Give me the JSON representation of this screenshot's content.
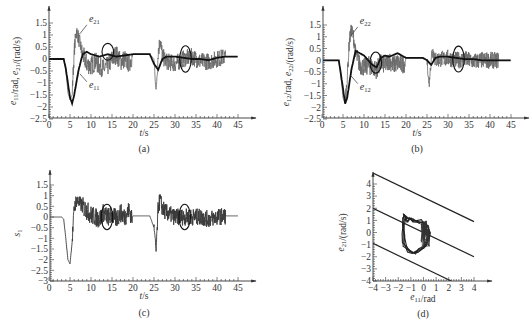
{
  "chart_data": [
    {
      "id": "a",
      "type": "line",
      "panel_label": "(a)",
      "xlabel": "t/s",
      "ylabel": "e11/rad, e21/(rad/s)",
      "xlim": [
        0,
        45
      ],
      "ylim": [
        -2.5,
        1.5
      ],
      "xticks": [
        0,
        5,
        10,
        15,
        20,
        25,
        30,
        35,
        40,
        45
      ],
      "yticks": [
        1.5,
        1,
        0.5,
        0,
        -0.5,
        -1,
        -1.5,
        -2,
        -2.5
      ],
      "ytick_labels": [
        "1.5",
        "1",
        "0.5",
        "0",
        "−0.5",
        "−1",
        "−1.5",
        "−2",
        "−2.5"
      ],
      "series": [
        {
          "name": "e21",
          "style": "noisy-gray",
          "x": [
            0,
            3.5,
            4,
            4.5,
            5,
            5.5,
            6,
            6.5,
            7,
            8,
            9,
            10,
            11,
            12,
            13,
            14,
            15,
            16,
            17,
            18,
            19,
            19.8,
            20,
            24,
            25,
            25.5,
            26,
            26.5,
            27,
            28,
            30,
            32,
            34,
            36,
            38,
            40,
            42,
            45
          ],
          "y": [
            0,
            0,
            -0.4,
            -1.4,
            -1.7,
            -1.5,
            0.3,
            1.2,
            0.9,
            0.2,
            -0.2,
            -0.3,
            -0.1,
            -0.3,
            -0.4,
            -0.3,
            0.0,
            0.2,
            -0.1,
            0.0,
            -0.2,
            0.1,
            0.2,
            0.2,
            0.0,
            -1.4,
            0.3,
            0.8,
            0.1,
            -0.1,
            -0.2,
            0.0,
            0.1,
            -0.1,
            -0.1,
            0.0,
            0.1,
            0.1
          ]
        },
        {
          "name": "e11",
          "style": "smooth-black",
          "x": [
            0,
            3.5,
            4,
            5,
            5.5,
            6,
            7,
            8,
            9,
            10,
            12,
            14,
            16,
            18,
            20,
            24,
            25,
            26,
            27,
            28,
            30,
            32,
            34,
            36,
            38,
            40,
            42,
            45
          ],
          "y": [
            0,
            0,
            -0.4,
            -1.6,
            -1.85,
            -1.5,
            -0.5,
            0.2,
            0.3,
            0.2,
            0.1,
            0.2,
            0.1,
            0.15,
            0.2,
            0.2,
            -0.2,
            -0.45,
            0.0,
            0.1,
            0.1,
            0.05,
            0.0,
            0.0,
            -0.05,
            0.05,
            0.1,
            0.1
          ]
        }
      ],
      "annotations": [
        {
          "text": "e21",
          "x": 9.5,
          "y": 1.55
        },
        {
          "text": "e11",
          "x": 9.5,
          "y": -1.2
        }
      ],
      "ellipses": [
        {
          "cx": 14,
          "cy": 0.3,
          "rx": 0.9,
          "ry": 0.35
        },
        {
          "cx": 32.5,
          "cy": 0.0,
          "rx": 0.9,
          "ry": 0.55
        }
      ]
    },
    {
      "id": "b",
      "type": "line",
      "panel_label": "(b)",
      "xlabel": "t/s",
      "ylabel": "e12/rad, e22/(rad/s)",
      "xlim": [
        0,
        45
      ],
      "ylim": [
        -2.5,
        1.5
      ],
      "xticks": [
        0,
        5,
        10,
        15,
        20,
        25,
        30,
        35,
        40,
        45
      ],
      "yticks": [
        1.5,
        1,
        0.5,
        0,
        -0.5,
        -1,
        -1.5,
        -2,
        -2.5
      ],
      "ytick_labels": [
        "1.5",
        "1",
        "0.5",
        "0",
        "−0.5",
        "−1",
        "−1.5",
        "−2",
        "−2.5"
      ],
      "series": [
        {
          "name": "e22",
          "style": "noisy-gray",
          "x": [
            0,
            4,
            4.5,
            5,
            5.5,
            6,
            6.5,
            7,
            7.5,
            8,
            9,
            10,
            11,
            12,
            13,
            14,
            15,
            16,
            17,
            18,
            19,
            19.8,
            20,
            24,
            25,
            25.5,
            26,
            26.5,
            27,
            28,
            30,
            32,
            34,
            36,
            38,
            40,
            42,
            45
          ],
          "y": [
            0,
            0,
            -0.6,
            -1.6,
            -1.8,
            -0.8,
            0.8,
            1.3,
            1.0,
            0.3,
            -0.2,
            -0.3,
            -0.2,
            -0.3,
            -0.4,
            -0.1,
            -0.2,
            0.0,
            -0.2,
            -0.1,
            -0.2,
            -0.1,
            0.1,
            0.1,
            0.0,
            -1.1,
            0.2,
            0.4,
            0.0,
            0.05,
            0.1,
            0.0,
            0.05,
            -0.05,
            0.0,
            0.0,
            0.0,
            0.0
          ]
        },
        {
          "name": "e12",
          "style": "smooth-black",
          "x": [
            0,
            4,
            5,
            5.5,
            6,
            7,
            8,
            9,
            10,
            11,
            12,
            13,
            14,
            15,
            16,
            18,
            19,
            20,
            24,
            25,
            26,
            27,
            28,
            30,
            32,
            34,
            36,
            38,
            40,
            42,
            45
          ],
          "y": [
            0,
            0,
            -1.2,
            -1.85,
            -1.6,
            -0.4,
            0.4,
            0.3,
            0.2,
            0.0,
            -0.2,
            -0.3,
            0.1,
            0.2,
            0.15,
            0.3,
            0.2,
            0.1,
            0.1,
            0.0,
            -0.2,
            0.1,
            0.15,
            0.15,
            0.1,
            0.05,
            0.05,
            0.0,
            0.0,
            0.0,
            0.0
          ]
        }
      ],
      "annotations": [
        {
          "text": "e22",
          "x": 9,
          "y": 1.55
        },
        {
          "text": "e12",
          "x": 9,
          "y": -1.25
        }
      ],
      "ellipses": [
        {
          "cx": 12.8,
          "cy": -0.1,
          "rx": 0.9,
          "ry": 0.45
        },
        {
          "cx": 32.5,
          "cy": 0.05,
          "rx": 0.9,
          "ry": 0.55
        }
      ]
    },
    {
      "id": "c",
      "type": "line",
      "panel_label": "(c)",
      "xlabel": "t/s",
      "ylabel": "s1",
      "xlim": [
        0,
        45
      ],
      "ylim": [
        -3,
        1.5
      ],
      "xticks": [
        0,
        5,
        10,
        15,
        20,
        25,
        30,
        35,
        40,
        45
      ],
      "yticks": [
        1.5,
        1,
        0.5,
        0,
        -0.5,
        -1,
        -1.5,
        -2,
        -2.5,
        -3
      ],
      "ytick_labels": [
        "1.5",
        "1",
        "0.5",
        "0",
        "−0.5",
        "−1",
        "−1.5",
        "−2",
        "−2.5",
        "−3"
      ],
      "series": [
        {
          "name": "s1",
          "style": "noisy-dark",
          "x": [
            0,
            3,
            3.5,
            4,
            4.5,
            5,
            5.5,
            6,
            6.5,
            7,
            8,
            9,
            10,
            11,
            12,
            13,
            14,
            15,
            16,
            17,
            18,
            19,
            19.8,
            20,
            24,
            25,
            25.5,
            26,
            26.5,
            27,
            28,
            30,
            32,
            34,
            36,
            38,
            40,
            42,
            45
          ],
          "y": [
            0,
            0,
            -0.1,
            -1.0,
            -2.0,
            -2.2,
            -1.2,
            0.4,
            0.8,
            0.7,
            0.5,
            0.3,
            0.1,
            0.0,
            -0.1,
            0.2,
            0.0,
            0.1,
            -0.1,
            0.2,
            0.0,
            0.3,
            0.0,
            0.05,
            0.05,
            -0.5,
            -1.6,
            0.5,
            0.8,
            0.4,
            0.2,
            0.0,
            0.0,
            0.0,
            0.0,
            -0.1,
            0.0,
            0.05,
            0.05
          ]
        }
      ],
      "annotations": [],
      "ellipses": [
        {
          "cx": 13.8,
          "cy": 0.0,
          "rx": 0.9,
          "ry": 0.6
        },
        {
          "cx": 32.3,
          "cy": 0.0,
          "rx": 0.9,
          "ry": 0.6
        }
      ]
    },
    {
      "id": "d",
      "type": "line",
      "panel_label": "(d)",
      "xlabel": "e11/rad",
      "ylabel": "e21/(rad/s)",
      "xlim": [
        -4,
        4
      ],
      "ylim": [
        -4,
        4
      ],
      "xticks": [
        -4,
        -3,
        -2,
        -1,
        0,
        1,
        2,
        3,
        4
      ],
      "xtick_labels": [
        "−4",
        "−3",
        "−2",
        "−1",
        "0",
        "1",
        "2",
        "3",
        "4"
      ],
      "yticks": [
        4,
        3,
        2,
        1,
        0,
        -1,
        -2,
        -3,
        -4
      ],
      "ytick_labels": [
        "4",
        "3",
        "2",
        "1",
        "0",
        "−1",
        "−2",
        "−3",
        "−4"
      ],
      "series": [
        {
          "name": "upper-boundary",
          "style": "line-black",
          "x": [
            -4,
            4
          ],
          "y": [
            4.9,
            0.9
          ]
        },
        {
          "name": "switching-line",
          "style": "line-black",
          "x": [
            -4,
            4
          ],
          "y": [
            2.0,
            -2.0
          ]
        },
        {
          "name": "lower-boundary",
          "style": "line-black",
          "x": [
            -4,
            2.2
          ],
          "y": [
            -0.9,
            -4.0
          ]
        },
        {
          "name": "phase-trajectory",
          "style": "loop-black",
          "x": [
            -1.5,
            -1.3,
            -1.0,
            -0.7,
            -0.3,
            0.1,
            0.3,
            0.4,
            0.3,
            0.1,
            -0.3,
            -0.8,
            -1.2,
            -1.5,
            -1.6,
            -1.55,
            -1.5
          ],
          "y": [
            1.4,
            1.0,
            1.1,
            1.0,
            0.9,
            0.8,
            0.4,
            0.0,
            -0.6,
            -1.2,
            -1.5,
            -1.6,
            -1.5,
            -1.0,
            -0.2,
            0.7,
            1.4
          ]
        }
      ],
      "annotations": [],
      "ellipses": []
    }
  ]
}
